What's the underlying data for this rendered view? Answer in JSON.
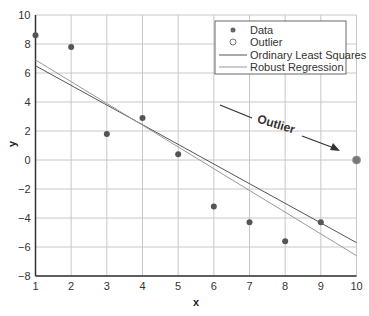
{
  "chart_data": {
    "type": "scatter",
    "title": "",
    "xlabel": "x",
    "ylabel": "y",
    "xlim": [
      1,
      10
    ],
    "ylim": [
      -8,
      10
    ],
    "xticks": [
      1,
      2,
      3,
      4,
      5,
      6,
      7,
      8,
      9,
      10
    ],
    "yticks": [
      -8,
      -6,
      -4,
      -2,
      0,
      2,
      4,
      6,
      8,
      10
    ],
    "grid": true,
    "legend_position": "upper right",
    "series": [
      {
        "name": "Data",
        "kind": "scatter",
        "marker": "filled-circle",
        "color": "#555555",
        "x": [
          1,
          2,
          3,
          4,
          5,
          6,
          7,
          8,
          9
        ],
        "y": [
          8.6,
          7.8,
          1.8,
          2.9,
          0.4,
          -3.2,
          -4.3,
          -5.6,
          -4.3
        ]
      },
      {
        "name": "Outlier",
        "kind": "scatter",
        "marker": "open-circle",
        "color": "#777777",
        "x": [
          10
        ],
        "y": [
          0
        ]
      },
      {
        "name": "Ordinary Least Squares",
        "kind": "line",
        "color": "#555555",
        "x": [
          1,
          10
        ],
        "y": [
          6.5,
          -5.7
        ]
      },
      {
        "name": "Robust Regression",
        "kind": "line",
        "color": "#999999",
        "x": [
          1,
          10
        ],
        "y": [
          6.9,
          -6.6
        ]
      }
    ],
    "annotations": [
      {
        "text": "Outlier",
        "arrow_to": [
          10,
          0
        ]
      }
    ]
  }
}
